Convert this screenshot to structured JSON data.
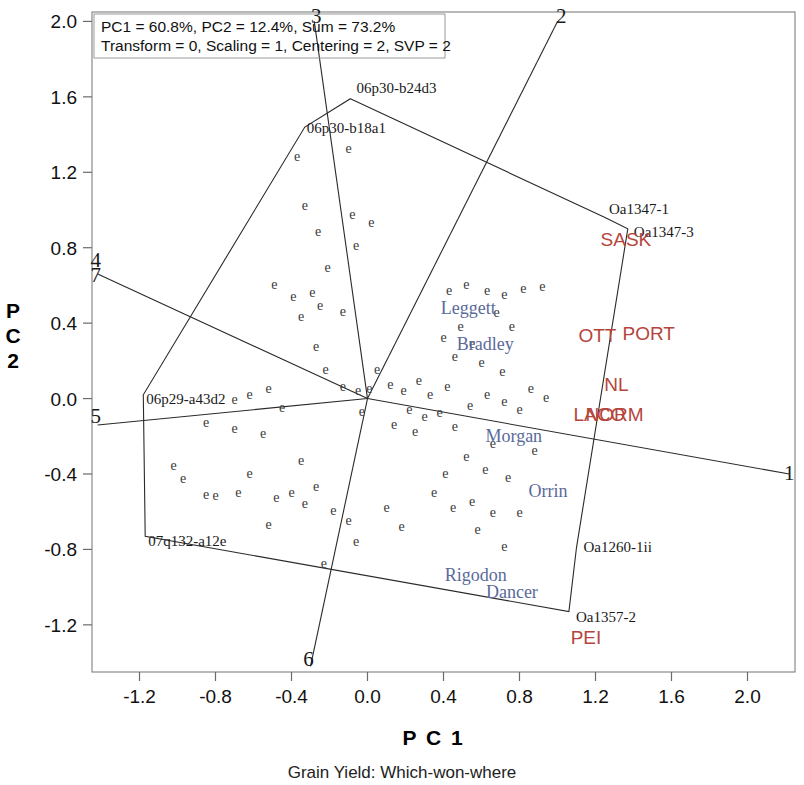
{
  "caption": "Grain Yield: Which-won-where",
  "header": {
    "line1": "PC1 = 60.8%, PC2 = 12.4%, Sum = 73.2%",
    "line2": "Transform = 0, Scaling = 1, Centering = 2, SVP = 2"
  },
  "axes": {
    "x_title": "P C 1",
    "y_title_chars": [
      "P",
      "C",
      "2"
    ],
    "x_ticks": [
      "-1.2",
      "-0.8",
      "-0.4",
      "0.0",
      "0.4",
      "0.8",
      "1.2",
      "1.6",
      "2.0"
    ],
    "y_ticks": [
      "2.0",
      "1.6",
      "1.2",
      "0.8",
      "0.4",
      "0.0",
      "-0.4",
      "-0.8",
      "-1.2"
    ]
  },
  "colors": {
    "environment": "#b5453c",
    "genotype": "#5a6a9a",
    "line": "#2a2a2a",
    "text": "#111111"
  },
  "chart_data": {
    "type": "scatter",
    "title": "Grain Yield: Which-won-where",
    "subtitle": "PC1 = 60.8%, PC2 = 12.4%, Sum = 73.2%",
    "xlabel": "P C 1",
    "ylabel": "P C 2",
    "xlim": [
      -1.45,
      2.25
    ],
    "ylim": [
      -1.45,
      2.05
    ],
    "grid": false,
    "legend": null,
    "origin": [
      0.0,
      0.0
    ],
    "sector_numbers": [
      {
        "label": "1",
        "x": 2.22,
        "y": -0.43
      },
      {
        "label": "2",
        "x": 1.02,
        "y": 1.99
      },
      {
        "label": "3",
        "x": -0.27,
        "y": 1.99
      },
      {
        "label": "4",
        "x": -1.43,
        "y": 0.7
      },
      {
        "label": "5",
        "x": -1.43,
        "y": -0.13
      },
      {
        "label": "6",
        "x": -0.31,
        "y": -1.42
      },
      {
        "label": "7",
        "x": -1.43,
        "y": 0.62
      }
    ],
    "vertex_genotypes": [
      {
        "name": "06p30-b24d3",
        "x": -0.09,
        "y": 1.59
      },
      {
        "name": "06p30-b18a1",
        "x": -0.33,
        "y": 1.44
      },
      {
        "name": "Oa1347-1",
        "x": 1.25,
        "y": 0.96
      },
      {
        "name": "Oa1347-3",
        "x": 1.37,
        "y": 0.9
      },
      {
        "name": "06p29-a43d2",
        "x": -1.18,
        "y": 0.02
      },
      {
        "name": "07q132-a12e",
        "x": -1.17,
        "y": -0.73
      },
      {
        "name": "Oa1260-1ii",
        "x": 1.1,
        "y": -0.79
      },
      {
        "name": "Oa1357-2",
        "x": 1.06,
        "y": -1.13
      }
    ],
    "named_genotypes": [
      {
        "name": "Leggett",
        "x": 0.53,
        "y": 0.45
      },
      {
        "name": "Bradley",
        "x": 0.62,
        "y": 0.26
      },
      {
        "name": "Morgan",
        "x": 0.77,
        "y": -0.23
      },
      {
        "name": "Orrin",
        "x": 0.95,
        "y": -0.52
      },
      {
        "name": "Rigodon",
        "x": 0.57,
        "y": -0.97
      },
      {
        "name": "Dancer",
        "x": 0.76,
        "y": -1.06
      }
    ],
    "environments": [
      {
        "name": "SASK",
        "x": 1.36,
        "y": 0.81
      },
      {
        "name": "OTT",
        "x": 1.21,
        "y": 0.3
      },
      {
        "name": "PORT",
        "x": 1.48,
        "y": 0.31
      },
      {
        "name": "NL",
        "x": 1.31,
        "y": 0.04
      },
      {
        "name": "LACO",
        "x": 1.22,
        "y": -0.12
      },
      {
        "name": "NORM",
        "x": 1.3,
        "y": -0.12
      },
      {
        "name": "PEI",
        "x": 1.15,
        "y": -1.3
      }
    ],
    "hull_polygon": [
      {
        "x": -0.09,
        "y": 1.59
      },
      {
        "x": 1.25,
        "y": 0.96
      },
      {
        "x": 1.37,
        "y": 0.9
      },
      {
        "x": 1.1,
        "y": -0.79
      },
      {
        "x": 1.06,
        "y": -1.13
      },
      {
        "x": -1.17,
        "y": -0.73
      },
      {
        "x": -1.18,
        "y": 0.02
      },
      {
        "x": -0.33,
        "y": 1.44
      }
    ],
    "sector_rays": [
      {
        "id": "ray-1",
        "to_x": 2.22,
        "to_y": -0.4
      },
      {
        "id": "ray-2",
        "to_x": 1.0,
        "to_y": 2.0
      },
      {
        "id": "ray-3",
        "to_x": -0.28,
        "to_y": 2.0
      },
      {
        "id": "ray-4",
        "to_x": -1.42,
        "to_y": 0.66
      },
      {
        "id": "ray-5",
        "to_x": -1.42,
        "to_y": -0.14
      },
      {
        "id": "ray-6",
        "to_x": -0.3,
        "to_y": -1.42
      }
    ],
    "data_points": {
      "marker": "e",
      "count": 92,
      "points": [
        {
          "x": -0.37,
          "y": 1.26
        },
        {
          "x": -0.1,
          "y": 1.3
        },
        {
          "x": -0.33,
          "y": 1.0
        },
        {
          "x": -0.08,
          "y": 0.95
        },
        {
          "x": 0.02,
          "y": 0.91
        },
        {
          "x": -0.26,
          "y": 0.86
        },
        {
          "x": -0.06,
          "y": 0.79
        },
        {
          "x": -0.21,
          "y": 0.67
        },
        {
          "x": -0.49,
          "y": 0.58
        },
        {
          "x": -0.39,
          "y": 0.52
        },
        {
          "x": -0.29,
          "y": 0.54
        },
        {
          "x": -0.35,
          "y": 0.41
        },
        {
          "x": -0.25,
          "y": 0.47
        },
        {
          "x": -0.13,
          "y": 0.44
        },
        {
          "x": -0.27,
          "y": 0.25
        },
        {
          "x": -0.22,
          "y": 0.13
        },
        {
          "x": -0.13,
          "y": 0.04
        },
        {
          "x": -0.05,
          "y": 0.02
        },
        {
          "x": 0.01,
          "y": 0.03
        },
        {
          "x": -0.03,
          "y": -0.09
        },
        {
          "x": -0.52,
          "y": 0.03
        },
        {
          "x": -0.62,
          "y": 0.0
        },
        {
          "x": -0.7,
          "y": -0.03
        },
        {
          "x": -0.45,
          "y": -0.07
        },
        {
          "x": -0.85,
          "y": -0.15
        },
        {
          "x": -0.7,
          "y": -0.18
        },
        {
          "x": -0.55,
          "y": -0.21
        },
        {
          "x": -1.02,
          "y": -0.38
        },
        {
          "x": -0.97,
          "y": -0.45
        },
        {
          "x": -0.85,
          "y": -0.53
        },
        {
          "x": -0.8,
          "y": -0.54
        },
        {
          "x": -0.68,
          "y": -0.52
        },
        {
          "x": -0.62,
          "y": -0.42
        },
        {
          "x": -0.48,
          "y": -0.55
        },
        {
          "x": -0.4,
          "y": -0.52
        },
        {
          "x": -0.33,
          "y": -0.58
        },
        {
          "x": -0.27,
          "y": -0.49
        },
        {
          "x": -0.18,
          "y": -0.62
        },
        {
          "x": -0.1,
          "y": -0.67
        },
        {
          "x": -0.06,
          "y": -0.78
        },
        {
          "x": -0.23,
          "y": -0.9
        },
        {
          "x": -0.52,
          "y": -0.69
        },
        {
          "x": 0.05,
          "y": 0.13
        },
        {
          "x": 0.12,
          "y": 0.05
        },
        {
          "x": 0.19,
          "y": 0.02
        },
        {
          "x": 0.27,
          "y": 0.07
        },
        {
          "x": 0.33,
          "y": 0.0
        },
        {
          "x": 0.42,
          "y": 0.04
        },
        {
          "x": 0.22,
          "y": -0.08
        },
        {
          "x": 0.3,
          "y": -0.12
        },
        {
          "x": 0.38,
          "y": -0.1
        },
        {
          "x": 0.14,
          "y": -0.16
        },
        {
          "x": 0.25,
          "y": -0.2
        },
        {
          "x": 0.46,
          "y": -0.17
        },
        {
          "x": 0.54,
          "y": -0.06
        },
        {
          "x": 0.63,
          "y": 0.0
        },
        {
          "x": 0.72,
          "y": -0.04
        },
        {
          "x": 0.8,
          "y": -0.08
        },
        {
          "x": 0.46,
          "y": 0.2
        },
        {
          "x": 0.55,
          "y": 0.27
        },
        {
          "x": 0.4,
          "y": 0.3
        },
        {
          "x": 0.49,
          "y": 0.36
        },
        {
          "x": 0.43,
          "y": 0.55
        },
        {
          "x": 0.52,
          "y": 0.58
        },
        {
          "x": 0.63,
          "y": 0.55
        },
        {
          "x": 0.72,
          "y": 0.53
        },
        {
          "x": 0.82,
          "y": 0.56
        },
        {
          "x": 0.92,
          "y": 0.57
        },
        {
          "x": 0.68,
          "y": 0.43
        },
        {
          "x": 0.76,
          "y": 0.36
        },
        {
          "x": 0.6,
          "y": 0.17
        },
        {
          "x": 0.71,
          "y": 0.12
        },
        {
          "x": 0.86,
          "y": 0.03
        },
        {
          "x": 0.94,
          "y": -0.02
        },
        {
          "x": 0.66,
          "y": -0.26
        },
        {
          "x": 0.88,
          "y": -0.3
        },
        {
          "x": 0.52,
          "y": -0.33
        },
        {
          "x": 0.62,
          "y": -0.4
        },
        {
          "x": 0.74,
          "y": -0.44
        },
        {
          "x": 0.41,
          "y": -0.42
        },
        {
          "x": 0.35,
          "y": -0.52
        },
        {
          "x": 0.45,
          "y": -0.6
        },
        {
          "x": 0.55,
          "y": -0.57
        },
        {
          "x": 0.66,
          "y": -0.63
        },
        {
          "x": 0.8,
          "y": -0.63
        },
        {
          "x": 0.58,
          "y": -0.72
        },
        {
          "x": 0.72,
          "y": -0.81
        },
        {
          "x": 0.18,
          "y": -0.7
        },
        {
          "x": 0.1,
          "y": -0.6
        },
        {
          "x": -0.35,
          "y": -0.35
        }
      ]
    }
  }
}
